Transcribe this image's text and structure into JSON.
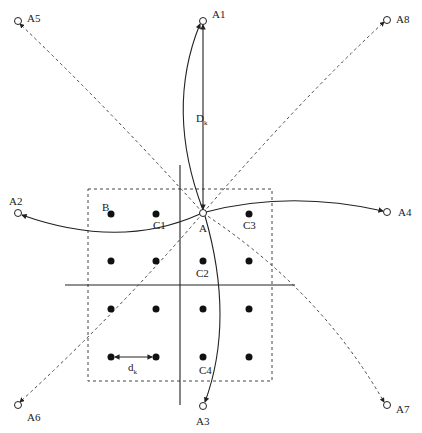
{
  "diagram": {
    "center_node": {
      "label": "A",
      "x": 203,
      "y": 213
    },
    "outer_nodes": [
      {
        "label": "A1",
        "x": 203,
        "y": 21,
        "label_x": 212,
        "label_y": 18
      },
      {
        "label": "A2",
        "x": 18,
        "y": 213,
        "label_x": 9,
        "label_y": 205
      },
      {
        "label": "A3",
        "x": 203,
        "y": 406,
        "label_x": 196,
        "label_y": 425
      },
      {
        "label": "A4",
        "x": 387,
        "y": 212,
        "label_x": 398,
        "label_y": 214
      },
      {
        "label": "A5",
        "x": 18,
        "y": 21,
        "label_x": 27,
        "label_y": 20
      },
      {
        "label": "A6",
        "x": 18,
        "y": 405,
        "label_x": 27,
        "label_y": 419
      },
      {
        "label": "A7",
        "x": 387,
        "y": 405,
        "label_x": 396,
        "label_y": 413
      },
      {
        "label": "A8",
        "x": 387,
        "y": 20,
        "label_x": 396,
        "label_y": 23
      }
    ],
    "grid_dots": [
      {
        "x": 111,
        "y": 214
      },
      {
        "x": 156,
        "y": 214
      },
      {
        "x": 249,
        "y": 214
      },
      {
        "x": 111,
        "y": 261
      },
      {
        "x": 156,
        "y": 261
      },
      {
        "x": 203,
        "y": 261
      },
      {
        "x": 249,
        "y": 261
      },
      {
        "x": 111,
        "y": 309
      },
      {
        "x": 156,
        "y": 309
      },
      {
        "x": 203,
        "y": 309
      },
      {
        "x": 249,
        "y": 309
      },
      {
        "x": 111,
        "y": 357
      },
      {
        "x": 156,
        "y": 357
      },
      {
        "x": 203,
        "y": 357
      },
      {
        "x": 249,
        "y": 357
      }
    ],
    "labels": {
      "B": "B",
      "C1": "C1",
      "C2": "C2",
      "C3": "C3",
      "C4": "C4",
      "A": "A",
      "D_main": "D",
      "D_sub": "k",
      "d_main": "d",
      "d_sub": "k"
    },
    "dashed_box": {
      "x": 88,
      "y": 189,
      "width": 184,
      "height": 192
    },
    "axes": {
      "vertical": {
        "x": 180,
        "y1": 165,
        "y2": 405
      },
      "horizontal": {
        "y": 285,
        "x1": 65,
        "x2": 295
      }
    }
  }
}
